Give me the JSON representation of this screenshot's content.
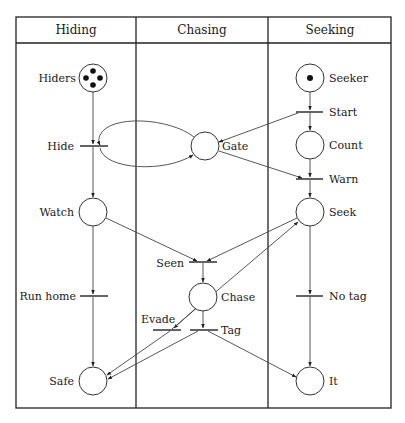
{
  "diagram": {
    "type": "petri-net",
    "columns": [
      {
        "id": "hiding",
        "label": "Hiding"
      },
      {
        "id": "chasing",
        "label": "Chasing"
      },
      {
        "id": "seeking",
        "label": "Seeking"
      }
    ],
    "places": {
      "hiders": {
        "label": "Hiders",
        "tokens": 4
      },
      "watch": {
        "label": "Watch",
        "tokens": 0
      },
      "safe": {
        "label": "Safe",
        "tokens": 0
      },
      "gate": {
        "label": "Gate",
        "tokens": 0
      },
      "chase": {
        "label": "Chase",
        "tokens": 0
      },
      "seeker": {
        "label": "Seeker",
        "tokens": 1
      },
      "count": {
        "label": "Count",
        "tokens": 0
      },
      "seek": {
        "label": "Seek",
        "tokens": 0
      },
      "it": {
        "label": "It",
        "tokens": 0
      }
    },
    "transitions": {
      "hide": {
        "label": "Hide"
      },
      "run_home": {
        "label": "Run home"
      },
      "seen": {
        "label": "Seen"
      },
      "evade": {
        "label": "Evade"
      },
      "tag": {
        "label": "Tag"
      },
      "start": {
        "label": "Start"
      },
      "warn": {
        "label": "Warn"
      },
      "no_tag": {
        "label": "No tag"
      }
    },
    "arcs": [
      [
        "hiders",
        "hide"
      ],
      [
        "hide",
        "watch"
      ],
      [
        "hide",
        "gate"
      ],
      [
        "gate",
        "hide"
      ],
      [
        "watch",
        "run_home"
      ],
      [
        "run_home",
        "safe"
      ],
      [
        "seeker",
        "start"
      ],
      [
        "start",
        "count"
      ],
      [
        "start",
        "gate"
      ],
      [
        "count",
        "warn"
      ],
      [
        "gate",
        "warn"
      ],
      [
        "warn",
        "seek"
      ],
      [
        "watch",
        "seen"
      ],
      [
        "seek",
        "seen"
      ],
      [
        "seen",
        "chase"
      ],
      [
        "chase",
        "evade"
      ],
      [
        "evade",
        "safe"
      ],
      [
        "evade",
        "seek"
      ],
      [
        "chase",
        "tag"
      ],
      [
        "tag",
        "safe"
      ],
      [
        "tag",
        "it"
      ],
      [
        "seek",
        "no_tag"
      ],
      [
        "no_tag",
        "it"
      ]
    ]
  }
}
